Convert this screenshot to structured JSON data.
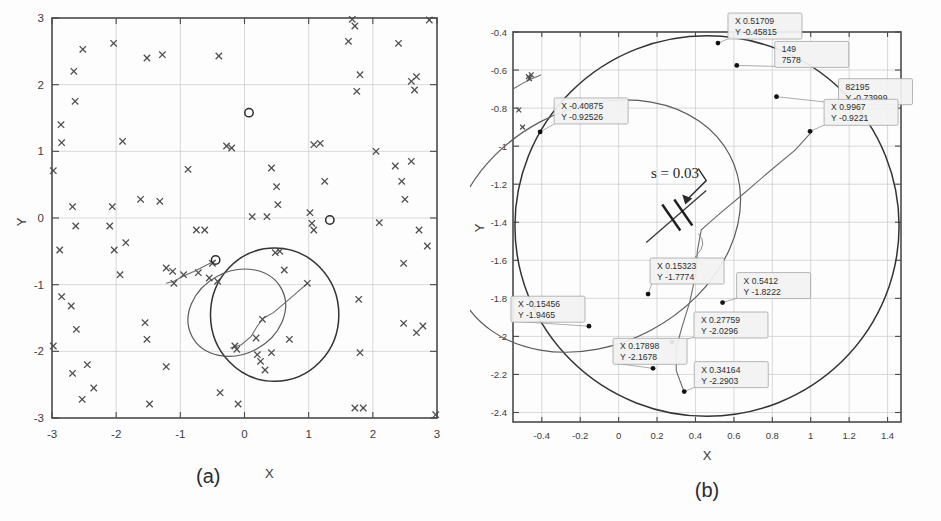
{
  "figure": {
    "panels": [
      {
        "id": "a",
        "caption": "(a)",
        "xlabel": "X",
        "ylabel": "Y"
      },
      {
        "id": "b",
        "caption": "(b)",
        "xlabel": "X",
        "ylabel": "Y"
      }
    ],
    "annotation_s": "s = 0.03"
  },
  "chart_data": [
    {
      "type": "scatter",
      "panel": "a",
      "title": "(a)",
      "xlabel": "X",
      "ylabel": "Y",
      "xlim": [
        -3,
        3
      ],
      "ylim": [
        -3,
        3
      ],
      "grid": true,
      "xticks": [
        "-3",
        "-2",
        "-1",
        "0",
        "1",
        "2",
        "3"
      ],
      "yticks": [
        "3",
        "2",
        "1",
        "0",
        "-1",
        "-2",
        "-3"
      ],
      "series": [
        {
          "name": "scatter-x-markers",
          "marker": "x",
          "color": "#4d4d4d",
          "points": [
            [
              -2.52,
              2.53
            ],
            [
              -2.66,
              2.2
            ],
            [
              -2.64,
              1.75
            ],
            [
              -2.86,
              1.4
            ],
            [
              -2.85,
              1.13
            ],
            [
              -2.98,
              0.71
            ],
            [
              -2.68,
              0.17
            ],
            [
              -2.63,
              -0.12
            ],
            [
              -2.88,
              -0.48
            ],
            [
              -2.85,
              -1.18
            ],
            [
              -2.7,
              -1.32
            ],
            [
              -2.62,
              -1.67
            ],
            [
              -2.98,
              -1.92
            ],
            [
              -2.68,
              -2.33
            ],
            [
              -2.45,
              -2.2
            ],
            [
              -2.35,
              -2.55
            ],
            [
              -2.53,
              -2.72
            ],
            [
              -2.04,
              2.62
            ],
            [
              -1.9,
              1.15
            ],
            [
              -2.06,
              0.17
            ],
            [
              -2.1,
              -0.12
            ],
            [
              -1.85,
              -0.37
            ],
            [
              -2.03,
              -0.48
            ],
            [
              -1.94,
              -0.85
            ],
            [
              -1.62,
              0.28
            ],
            [
              -1.52,
              2.4
            ],
            [
              -1.55,
              -1.57
            ],
            [
              -1.52,
              -1.82
            ],
            [
              -1.48,
              -2.79
            ],
            [
              -1.28,
              2.45
            ],
            [
              -1.32,
              0.25
            ],
            [
              -1.22,
              -0.75
            ],
            [
              -1.22,
              -2.23
            ],
            [
              -1.12,
              -0.8
            ],
            [
              -1.1,
              -0.98
            ],
            [
              -0.95,
              -0.85
            ],
            [
              -0.88,
              0.73
            ],
            [
              -0.75,
              -0.18
            ],
            [
              -0.62,
              -0.18
            ],
            [
              -0.72,
              -0.82
            ],
            [
              -0.55,
              -0.9
            ],
            [
              -0.5,
              -0.68
            ],
            [
              -0.42,
              -0.95
            ],
            [
              -0.38,
              -2.62
            ],
            [
              -0.4,
              2.43
            ],
            [
              -0.28,
              1.08
            ],
            [
              -0.2,
              1.05
            ],
            [
              -0.15,
              -1.92
            ],
            [
              -0.12,
              -1.97
            ],
            [
              -0.1,
              -2.79
            ],
            [
              0.12,
              0.02
            ],
            [
              0.18,
              -1.8
            ],
            [
              0.2,
              -2.05
            ],
            [
              0.25,
              -2.15
            ],
            [
              0.32,
              -2.28
            ],
            [
              0.28,
              -1.52
            ],
            [
              0.35,
              0.02
            ],
            [
              0.42,
              -2.02
            ],
            [
              0.48,
              -0.52
            ],
            [
              0.55,
              -0.5
            ],
            [
              0.42,
              0.75
            ],
            [
              0.5,
              0.47
            ],
            [
              0.52,
              0.2
            ],
            [
              0.62,
              -0.78
            ],
            [
              0.7,
              -1.82
            ],
            [
              0.98,
              -0.98
            ],
            [
              1.02,
              0.08
            ],
            [
              1.05,
              -0.08
            ],
            [
              1.08,
              -0.18
            ],
            [
              1.08,
              1.1
            ],
            [
              1.18,
              1.12
            ],
            [
              1.25,
              0.55
            ],
            [
              1.68,
              2.98
            ],
            [
              1.72,
              2.88
            ],
            [
              1.62,
              2.65
            ],
            [
              1.8,
              2.15
            ],
            [
              1.75,
              1.9
            ],
            [
              1.78,
              -1.22
            ],
            [
              1.8,
              -2.02
            ],
            [
              1.72,
              -2.85
            ],
            [
              1.85,
              -2.85
            ],
            [
              2.05,
              1.0
            ],
            [
              2.1,
              -0.07
            ],
            [
              2.35,
              0.78
            ],
            [
              2.4,
              2.62
            ],
            [
              2.45,
              0.55
            ],
            [
              2.48,
              -0.68
            ],
            [
              2.5,
              0.28
            ],
            [
              2.48,
              -1.58
            ],
            [
              2.6,
              2.05
            ],
            [
              2.68,
              2.12
            ],
            [
              2.65,
              1.92
            ],
            [
              2.6,
              0.85
            ],
            [
              2.72,
              -0.18
            ],
            [
              2.68,
              -1.72
            ],
            [
              2.78,
              -1.62
            ],
            [
              2.85,
              -0.42
            ],
            [
              2.88,
              2.97
            ],
            [
              2.98,
              -2.95
            ]
          ]
        },
        {
          "name": "circle-o-markers",
          "marker": "o",
          "color": "#2b2b2b",
          "points": [
            [
              0.07,
              1.58
            ],
            [
              1.33,
              -0.03
            ],
            [
              -0.45,
              -0.63
            ]
          ]
        }
      ],
      "shapes": [
        {
          "kind": "circle",
          "cx": 0.47,
          "cy": -1.45,
          "r": 1.0
        },
        {
          "kind": "ellipse",
          "cx": -0.12,
          "cy": -1.42,
          "rx": 0.79,
          "ry": 0.62,
          "rotation": -28
        }
      ]
    },
    {
      "type": "scatter",
      "panel": "b",
      "title": "(b)",
      "xlabel": "X",
      "ylabel": "Y",
      "xlim": [
        -0.55,
        1.47
      ],
      "ylim": [
        -2.45,
        -0.4
      ],
      "grid": true,
      "xticks": [
        "-0.4",
        "-0.2",
        "0",
        "0.2",
        "0.4",
        "0.6",
        "0.8",
        "1",
        "1.2",
        "1.4"
      ],
      "yticks": [
        "-0.4",
        "-0.6",
        "-0.8",
        "-1",
        "-1.2",
        "-1.4",
        "-1.6",
        "-1.8",
        "-2",
        "-2.2",
        "-2.4"
      ],
      "datacursors": [
        {
          "x_label": "X -0.40875",
          "y_label": "Y -0.92526",
          "x": -0.40875,
          "y": -0.92526
        },
        {
          "x_label": "X 0.51709",
          "y_label": "Y -0.45815",
          "x": 0.51709,
          "y": -0.45815
        },
        {
          "x_label": "X 0.6149",
          "y_label": "Y -0.57578",
          "x": 0.6149,
          "y": -0.57578,
          "occluded": true,
          "visible_fragment_x": "149",
          "visible_fragment_y": "7578"
        },
        {
          "x_label": "X 0.82195",
          "y_label": "Y -0.73999",
          "x": 0.82195,
          "y": -0.73999,
          "occluded": true,
          "visible_fragment_x": "82195"
        },
        {
          "x_label": "X 0.9967",
          "y_label": "Y -0.9221",
          "x": 0.9967,
          "y": -0.9221
        },
        {
          "x_label": "X 0.15323",
          "y_label": "Y -1.7774",
          "x": 0.15323,
          "y": -1.7774
        },
        {
          "x_label": "X 0.5412",
          "y_label": "Y -1.8222",
          "x": 0.5412,
          "y": -1.8222
        },
        {
          "x_label": "X -0.15456",
          "y_label": "Y -1.9465",
          "x": -0.15456,
          "y": -1.9465
        },
        {
          "x_label": "X 0.27759",
          "y_label": "Y -2.0296",
          "x": 0.27759,
          "y": -2.0296
        },
        {
          "x_label": "X 0.17898",
          "y_label": "Y -2.1678",
          "x": 0.17898,
          "y": -2.1678
        },
        {
          "x_label": "X 0.34164",
          "y_label": "Y -2.2903",
          "x": 0.34164,
          "y": -2.2903
        }
      ],
      "annotations": [
        {
          "text": "s = 0.03",
          "x": 0.33,
          "y": -1.16
        }
      ],
      "shapes": [
        {
          "kind": "circle",
          "cx": 0.46,
          "cy": -1.42,
          "r": 1.0
        },
        {
          "kind": "ellipse",
          "cx": -0.12,
          "cy": -1.42,
          "rx": 0.79,
          "ry": 0.62,
          "rotation": -28
        }
      ]
    }
  ],
  "colors": {
    "marker": "#4d4d4d",
    "circle": "#333333",
    "grid": "#c9c9c9",
    "frame": "#4a4a4a",
    "label_box": "#f2f2f2"
  }
}
